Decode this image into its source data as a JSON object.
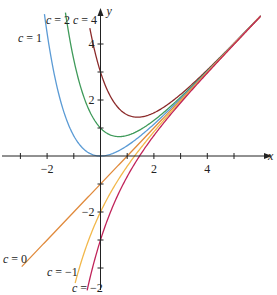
{
  "chart_data": {
    "type": "line",
    "title": "",
    "function": "y = x - 1 + c*e^(-x)",
    "xlabel": "x",
    "ylabel": "y",
    "xlim": [
      -3.8,
      6.4
    ],
    "ylim": [
      -4.9,
      5.6
    ],
    "x_ticks": [
      -3,
      -2,
      -1,
      1,
      2,
      3,
      4,
      5
    ],
    "x_tick_labels": {
      "-2": "-2",
      "2": "2",
      "4": "4"
    },
    "y_ticks": [
      -4,
      -3,
      -2,
      -1,
      1,
      2,
      3,
      4
    ],
    "y_tick_labels": {
      "-2": "-2",
      "2": "2",
      "4": "4"
    },
    "grid": false,
    "series": [
      {
        "name": "c = 4",
        "c": 4,
        "color": "#8b2a2a",
        "x_range": [
          -0.4,
          6.0
        ]
      },
      {
        "name": "c = 2",
        "c": 2,
        "color": "#3f9a5a",
        "x_range": [
          -1.35,
          6.0
        ]
      },
      {
        "name": "c = 1",
        "c": 1,
        "color": "#5b9bd5",
        "x_range": [
          -2.1,
          6.0
        ]
      },
      {
        "name": "c = 0",
        "c": 0,
        "color": "#e08a3c",
        "x_range": [
          -2.95,
          5.95
        ]
      },
      {
        "name": "c = -1",
        "c": -1,
        "color": "#f2b84b",
        "x_range": [
          -0.95,
          6.0
        ]
      },
      {
        "name": "c = -2",
        "c": -2,
        "color": "#c0245a",
        "x_range": [
          -0.5,
          6.0
        ]
      }
    ],
    "annotations": [
      {
        "text": "c = 1",
        "x": 18,
        "y": 42
      },
      {
        "text": "c = 2",
        "x": 46,
        "y": 24
      },
      {
        "text": "c = 4",
        "x": 73,
        "y": 24
      },
      {
        "text": "c = 0",
        "x": 3,
        "y": 263
      },
      {
        "text": "c = −1",
        "x": 47,
        "y": 276
      },
      {
        "text": "c = −2",
        "x": 72,
        "y": 292
      }
    ]
  },
  "axes": {
    "x_label": "x",
    "y_label": "y"
  }
}
